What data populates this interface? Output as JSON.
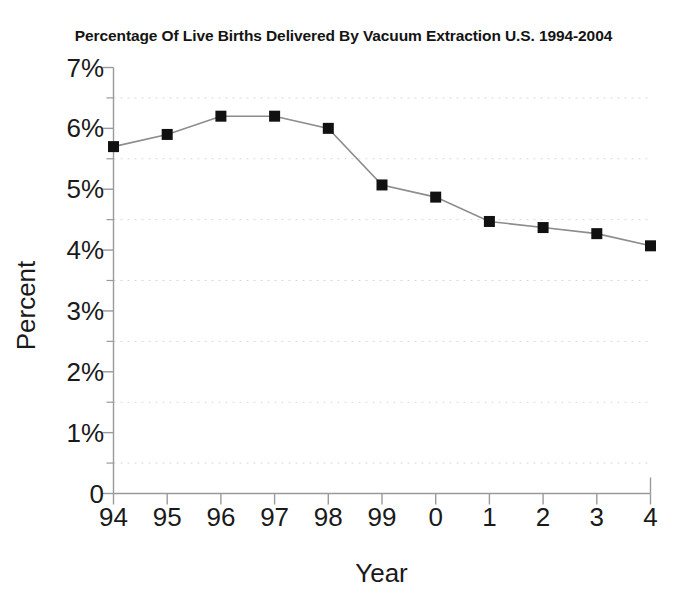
{
  "chart_data": {
    "type": "line",
    "title": "Percentage Of Live Births Delivered By Vacuum Extraction U.S. 1994-2004",
    "xlabel": "Year",
    "ylabel": "Percent",
    "categories": [
      "94",
      "95",
      "96",
      "97",
      "98",
      "99",
      "0",
      "1",
      "2",
      "3",
      "4"
    ],
    "values": [
      5.7,
      5.9,
      6.2,
      6.2,
      6.0,
      5.07,
      4.87,
      4.47,
      4.37,
      4.27,
      4.07
    ],
    "series": [
      {
        "name": "Percentage of live births delivered by vacuum extraction",
        "values": [
          5.7,
          5.9,
          6.2,
          6.2,
          6.0,
          5.07,
          4.87,
          4.47,
          4.37,
          4.27,
          4.07
        ]
      }
    ],
    "ylim": [
      0,
      7
    ],
    "ytick_values": [
      0,
      1,
      2,
      3,
      4,
      5,
      6,
      7
    ],
    "ytick_labels": [
      "0",
      "1%",
      "2%",
      "3%",
      "4%",
      "5%",
      "6%",
      "7%"
    ],
    "minor_ytick_values": [
      0.5,
      1.5,
      2.5,
      3.5,
      4.5,
      5.5,
      6.5
    ],
    "grid": "minor-horizontal-dotted",
    "legend": "none",
    "marker": "filled-square",
    "marker_color": "#111111",
    "line_color": "#8c8c8c",
    "axis_color": "#9a9a9a",
    "gridline_color": "#d8d8d8"
  },
  "axes": {
    "y_title": "Percent",
    "x_title": "Year"
  }
}
